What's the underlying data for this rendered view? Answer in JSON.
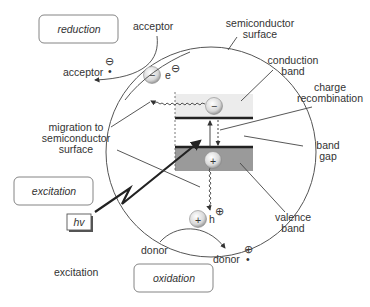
{
  "diagram": {
    "boxes": {
      "reduction": "reduction",
      "excitation": "excitation",
      "oxidation": "oxidation",
      "photon": "hv"
    },
    "labels": {
      "acceptor_top": "acceptor",
      "acceptor_left": "acceptor",
      "surface_line1": "semiconductor",
      "surface_line2": "surface",
      "conduction_line1": "conduction",
      "conduction_line2": "band",
      "recomb_line1": "charge",
      "recomb_line2": "recombination",
      "gap_line1": "band",
      "gap_line2": "gap",
      "migration_line1": "migration to",
      "migration_line2": "semiconductor",
      "migration_line3": "surface",
      "valence_line1": "valence",
      "valence_line2": "band",
      "donor_left": "donor",
      "donor_right": "donor",
      "excitation_plain": "excitation",
      "electron": "e",
      "hole": "h"
    },
    "symbols": {
      "minus": "−",
      "plus": "+",
      "circled_minus": "⊖",
      "circled_plus": "⊕",
      "dot": "•"
    },
    "colors": {
      "conduction_band": "#ececec",
      "valence_band": "#9a9a9a",
      "band_edge": "#222222",
      "circle": "#555555"
    }
  }
}
